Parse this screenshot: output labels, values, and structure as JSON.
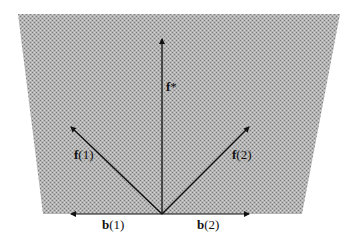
{
  "diagram": {
    "type": "vector-diagram",
    "region": {
      "shape": "trapezoid",
      "fill": "#a9a9a9",
      "points": [
        [
          18,
          14
        ],
        [
          340,
          14
        ],
        [
          302,
          214
        ],
        [
          43,
          214
        ]
      ]
    },
    "origin": [
      162,
      214
    ],
    "colors": {
      "arrow": "#111111",
      "text": "#111111"
    },
    "vectors": [
      {
        "id": "f-star",
        "label_bold": "f",
        "label_rest": "*",
        "tip": [
          162,
          38
        ]
      },
      {
        "id": "f1",
        "label_bold": "f",
        "label_rest": "(1)",
        "tip": [
          70,
          126
        ]
      },
      {
        "id": "f2",
        "label_bold": "f",
        "label_rest": "(2)",
        "tip": [
          250,
          126
        ]
      },
      {
        "id": "b1",
        "label_bold": "b",
        "label_rest": "(1)",
        "tip": [
          70,
          214
        ]
      },
      {
        "id": "b2",
        "label_bold": "b",
        "label_rest": "(2)",
        "tip": [
          250,
          214
        ]
      }
    ]
  }
}
